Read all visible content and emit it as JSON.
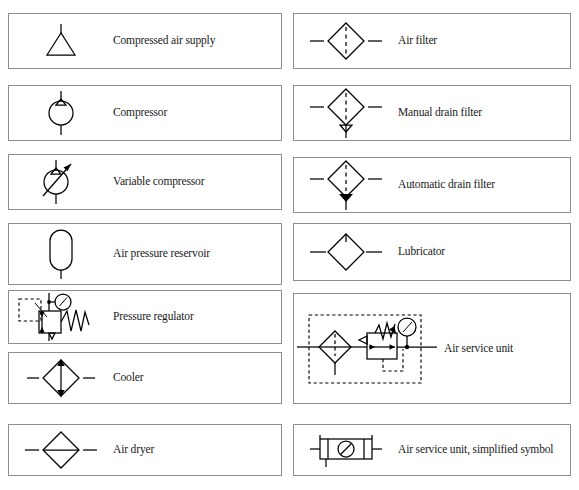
{
  "document": {
    "title": "Pneumatic energy supply and air preparation symbols",
    "background_color": "#ffffff",
    "line_color": "#000000",
    "box_border_color": "#8d8d8d",
    "text_color": "#1a1a1a"
  },
  "columns": {
    "left": {
      "items": [
        {
          "label": "Compressed air supply",
          "symbol": "compressed-air-supply"
        },
        {
          "label": "Compressor",
          "symbol": "compressor"
        },
        {
          "label": "Variable compressor",
          "symbol": "variable-compressor"
        },
        {
          "label": "Air pressure reservoir",
          "symbol": "air-pressure-reservoir"
        },
        {
          "label": "Pressure regulator",
          "symbol": "pressure-regulator"
        },
        {
          "label": "Cooler",
          "symbol": "cooler"
        },
        {
          "label": "Air dryer",
          "symbol": "air-dryer"
        }
      ]
    },
    "right": {
      "items": [
        {
          "label": "Air filter",
          "symbol": "air-filter"
        },
        {
          "label": "Manual drain filter",
          "symbol": "manual-drain-filter"
        },
        {
          "label": "Automatic drain filter",
          "symbol": "automatic-drain-filter"
        },
        {
          "label": "Lubricator",
          "symbol": "lubricator"
        },
        {
          "label": "Air service unit",
          "symbol": "air-service-unit"
        },
        {
          "label": "Air service unit, simplified symbol",
          "symbol": "air-service-unit-simplified"
        }
      ]
    }
  }
}
